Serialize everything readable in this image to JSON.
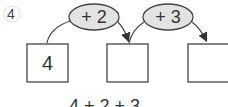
{
  "problem": {
    "number": "4",
    "operations": [
      "+ 2",
      "+ 3"
    ],
    "boxes": [
      "4",
      "",
      ""
    ],
    "answer_line": "→ 4 + 2 + 3"
  }
}
